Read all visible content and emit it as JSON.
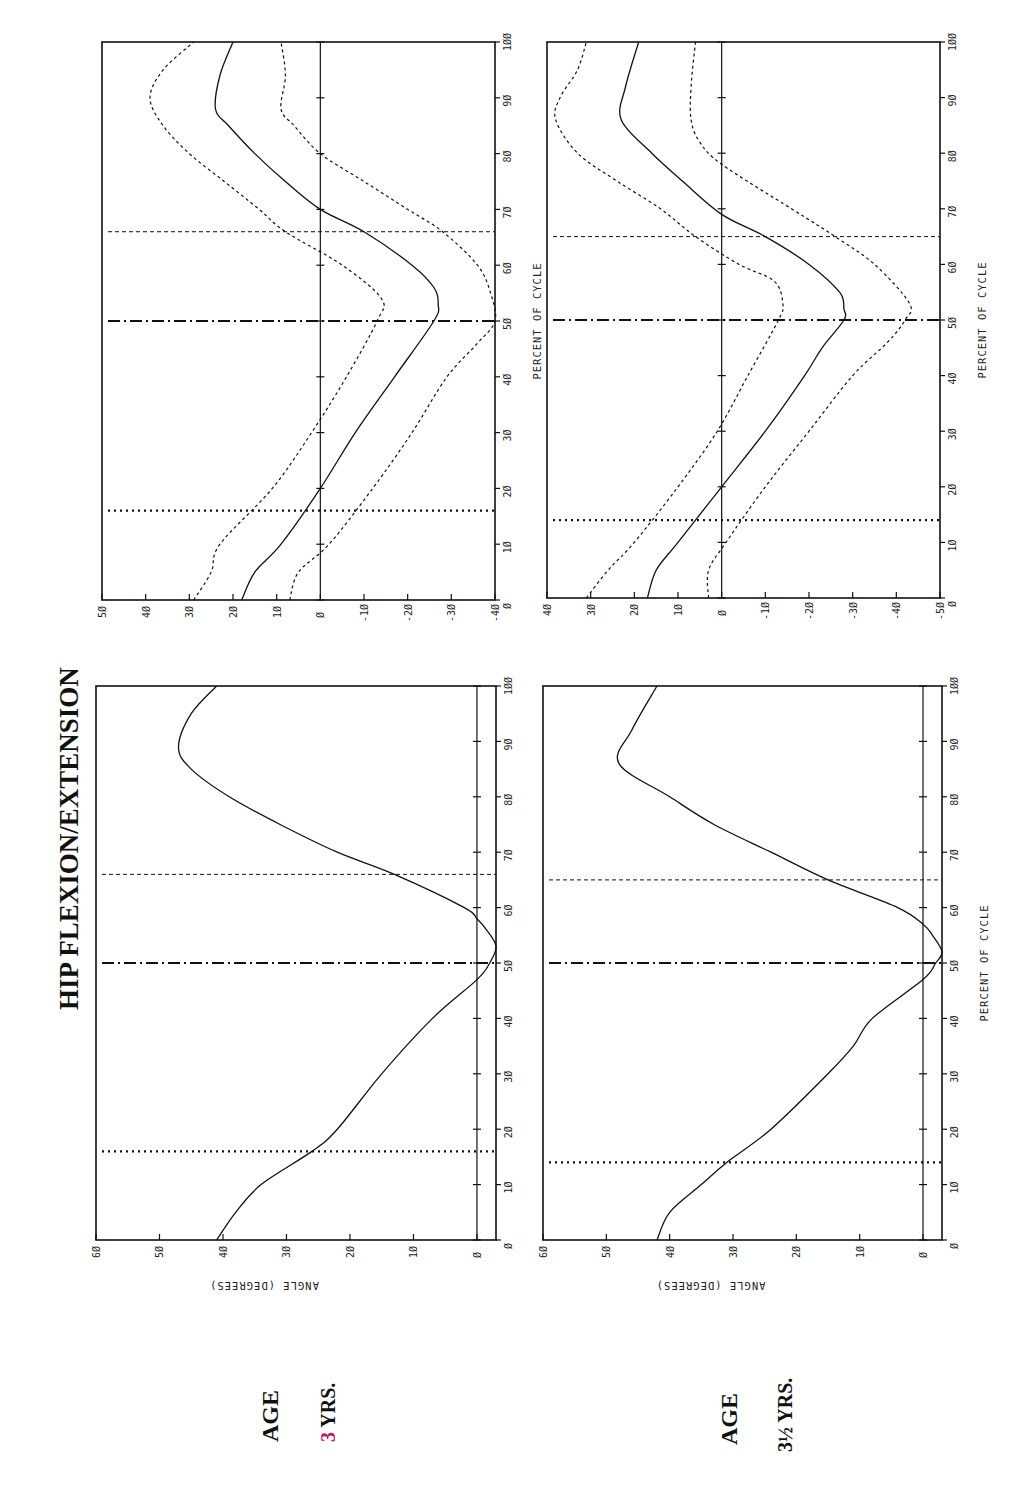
{
  "title": "HIP FLEXION/EXTENSION",
  "age_labels": [
    {
      "age_word": "AGE",
      "value": "3",
      "unit": "YRS."
    },
    {
      "age_word": "AGE",
      "value": "3½",
      "unit": "YRS."
    }
  ],
  "axis_labels": {
    "x": "PERCENT OF CYCLE",
    "y": "ANGLE (DEGREES)"
  },
  "chart_data": [
    {
      "type": "line",
      "id": "age3_mean",
      "title": "HIP FLEXION/EXTENSION — AGE 3 YRS.",
      "xlabel": "PERCENT OF CYCLE",
      "ylabel": "ANGLE (DEGREES)",
      "xlim": [
        0,
        100
      ],
      "ylim": [
        -3,
        60
      ],
      "x_ticks": [
        0,
        10,
        20,
        30,
        40,
        50,
        60,
        70,
        80,
        90,
        100
      ],
      "y_ticks": [
        0,
        10,
        20,
        30,
        40,
        50,
        60
      ],
      "grid": false,
      "zero_line": true,
      "series": [
        {
          "name": "mean",
          "style": "solid",
          "x": [
            0,
            5,
            10,
            16,
            20,
            30,
            40,
            47,
            50,
            53,
            56,
            58,
            60,
            66,
            70,
            75,
            80,
            85,
            89,
            95,
            100
          ],
          "values": [
            41,
            38,
            34,
            26,
            22,
            15,
            7,
            0,
            -2,
            -3,
            -1.5,
            0,
            2,
            13,
            22,
            31,
            39,
            45,
            47,
            45,
            41
          ]
        }
      ],
      "event_markers": [
        {
          "name": "opposite foot off",
          "style": "dotted",
          "x": 16
        },
        {
          "name": "opposite foot strike",
          "style": "dash-dot",
          "x": 50
        },
        {
          "name": "toe off",
          "style": "dashed",
          "x": 66
        }
      ]
    },
    {
      "type": "line",
      "id": "age3_sd",
      "title": "HIP FLEXION/EXTENSION — AGE 3 YRS. (mean ± 2 SD)",
      "xlabel": "PERCENT OF CYCLE",
      "ylabel": "",
      "xlim": [
        0,
        100
      ],
      "ylim": [
        -40,
        50
      ],
      "x_ticks": [
        0,
        10,
        20,
        30,
        40,
        50,
        60,
        70,
        80,
        90,
        100
      ],
      "y_ticks": [
        -40,
        -30,
        -20,
        -10,
        0,
        10,
        20,
        30,
        40,
        50
      ],
      "grid": false,
      "zero_line": true,
      "series": [
        {
          "name": "mean",
          "style": "solid",
          "x": [
            0,
            5,
            10,
            20,
            30,
            40,
            50,
            53,
            56,
            60,
            66,
            70,
            75,
            80,
            85,
            88,
            94,
            100
          ],
          "values": [
            18,
            15,
            9,
            0,
            -8,
            -17,
            -26,
            -27,
            -26,
            -21,
            -10,
            0,
            8,
            15,
            21,
            24,
            23,
            20
          ]
        },
        {
          "name": "upper band",
          "style": "dashed",
          "x": [
            0,
            5,
            10,
            20,
            30,
            40,
            50,
            54,
            60,
            66,
            70,
            75,
            80,
            85,
            90,
            95,
            100
          ],
          "values": [
            29,
            25,
            23,
            11,
            2,
            -6,
            -13,
            -14,
            -5,
            8,
            14,
            22,
            30,
            36,
            39,
            36,
            29
          ]
        },
        {
          "name": "lower band",
          "style": "dashed",
          "x": [
            0,
            5,
            10,
            20,
            30,
            40,
            46,
            50,
            55,
            60,
            66,
            70,
            75,
            80,
            85,
            88,
            94,
            100
          ],
          "values": [
            7,
            5,
            -2,
            -12,
            -21,
            -29,
            -36,
            -40,
            -39,
            -36,
            -28,
            -20,
            -10,
            0,
            6,
            9,
            8,
            9
          ]
        }
      ],
      "event_markers": [
        {
          "name": "opposite foot off",
          "style": "dotted",
          "x": 16
        },
        {
          "name": "opposite foot strike",
          "style": "dash-dot",
          "x": 50
        },
        {
          "name": "toe off",
          "style": "dashed",
          "x": 66
        }
      ]
    },
    {
      "type": "line",
      "id": "age35_mean",
      "title": "HIP FLEXION/EXTENSION — AGE 3½ YRS.",
      "xlabel": "PERCENT OF CYCLE",
      "ylabel": "ANGLE (DEGREES)",
      "xlim": [
        0,
        100
      ],
      "ylim": [
        -3,
        60
      ],
      "x_ticks": [
        0,
        10,
        20,
        30,
        40,
        50,
        60,
        70,
        80,
        90,
        100
      ],
      "y_ticks": [
        0,
        10,
        20,
        30,
        40,
        50,
        60
      ],
      "grid": false,
      "zero_line": true,
      "series": [
        {
          "name": "mean",
          "style": "solid",
          "x": [
            0,
            5,
            10,
            14,
            20,
            30,
            35,
            40,
            47,
            50,
            52,
            55,
            57,
            60,
            65,
            70,
            75,
            80,
            86,
            92,
            100
          ],
          "values": [
            42,
            40,
            35,
            31,
            24,
            15,
            11,
            8,
            0,
            -2,
            -3,
            -1.5,
            0,
            4,
            15,
            24,
            33,
            40,
            48,
            46,
            42
          ]
        }
      ],
      "event_markers": [
        {
          "name": "opposite foot off",
          "style": "dotted",
          "x": 14
        },
        {
          "name": "opposite foot strike",
          "style": "dash-dot",
          "x": 50
        },
        {
          "name": "toe off",
          "style": "dashed",
          "x": 65
        }
      ]
    },
    {
      "type": "line",
      "id": "age35_sd",
      "title": "HIP FLEXION/EXTENSION — AGE 3½ YRS. (mean ± 2 SD)",
      "xlabel": "PERCENT OF CYCLE",
      "ylabel": "",
      "xlim": [
        0,
        100
      ],
      "ylim": [
        -50,
        40
      ],
      "x_ticks": [
        0,
        10,
        20,
        30,
        40,
        50,
        60,
        70,
        80,
        90,
        100
      ],
      "y_ticks": [
        -50,
        -40,
        -30,
        -20,
        -10,
        0,
        10,
        20,
        30,
        40
      ],
      "grid": false,
      "zero_line": true,
      "series": [
        {
          "name": "mean",
          "style": "solid",
          "x": [
            0,
            5,
            10,
            20,
            30,
            40,
            45,
            50,
            52,
            55,
            60,
            65,
            69,
            75,
            80,
            86,
            92,
            100
          ],
          "values": [
            17,
            15,
            10,
            0,
            -10,
            -19,
            -23,
            -28,
            -28,
            -27,
            -20,
            -10,
            0,
            9,
            16,
            23,
            22,
            19
          ]
        },
        {
          "name": "upper band",
          "style": "dashed",
          "x": [
            0,
            5,
            10,
            20,
            30,
            40,
            50,
            53,
            57,
            60,
            65,
            70,
            75,
            80,
            86,
            90,
            95,
            100
          ],
          "values": [
            31,
            26,
            20,
            10,
            1,
            -6,
            -13,
            -14,
            -12,
            -4,
            6,
            14,
            24,
            33,
            38,
            37,
            33,
            31
          ]
        },
        {
          "name": "lower band",
          "style": "dashed",
          "x": [
            0,
            5,
            10,
            20,
            30,
            40,
            46,
            50,
            53,
            60,
            65,
            70,
            78,
            82,
            86,
            92,
            100
          ],
          "values": [
            3,
            3,
            -1,
            -10,
            -20,
            -30,
            -38,
            -42,
            -43,
            -35,
            -26,
            -16,
            0,
            5,
            7,
            7,
            6
          ]
        }
      ],
      "event_markers": [
        {
          "name": "opposite foot off",
          "style": "dotted",
          "x": 14
        },
        {
          "name": "opposite foot strike",
          "style": "dash-dot",
          "x": 50
        },
        {
          "name": "toe off",
          "style": "dashed",
          "x": 65
        }
      ]
    }
  ],
  "layout": {
    "panels": [
      {
        "chart": 1,
        "left": 102,
        "top": 42,
        "right": 495,
        "bottom": 600,
        "show_ylabel": false,
        "show_xlabel": true
      },
      {
        "chart": 0,
        "left": 96,
        "top": 686,
        "right": 496,
        "bottom": 1240,
        "show_ylabel": true,
        "show_xlabel": false
      },
      {
        "chart": 3,
        "left": 547,
        "top": 42,
        "right": 940,
        "bottom": 598,
        "show_ylabel": false,
        "show_xlabel": true
      },
      {
        "chart": 2,
        "left": 543,
        "top": 686,
        "right": 942,
        "bottom": 1240,
        "show_ylabel": true,
        "show_xlabel": true
      }
    ]
  }
}
